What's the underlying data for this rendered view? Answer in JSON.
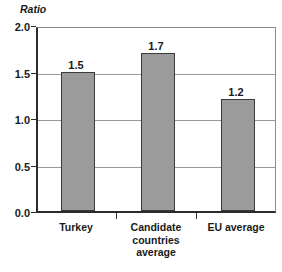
{
  "chart_data": {
    "type": "bar",
    "title": "",
    "subtitle": "",
    "xlabel": "",
    "ylabel": "Ratio",
    "categories": [
      "Turkey",
      "Candidate countries average",
      "EU average"
    ],
    "category_lines": [
      [
        "Turkey"
      ],
      [
        "Candidate",
        "countries",
        "average"
      ],
      [
        "EU average"
      ]
    ],
    "values": [
      1.5,
      1.7,
      1.2
    ],
    "value_labels": [
      "1.5",
      "1.7",
      "1.2"
    ],
    "ylim": [
      0.0,
      2.0
    ],
    "yticks": [
      0.0,
      0.5,
      1.0,
      1.5,
      2.0
    ],
    "ytick_labels": [
      "0.0",
      "0.5",
      "1.0",
      "1.5",
      "2.0"
    ],
    "grid": true,
    "grid_axis": "y",
    "legend": false,
    "legend_position": "none",
    "bar_color": "#9b9b9b",
    "bar_edge_color": "#3a3a3a",
    "axis_color": "#2b2b2b",
    "grid_color": "#9a9a9a",
    "background_color": "#ffffff",
    "text_color": "#1a1a1a"
  }
}
